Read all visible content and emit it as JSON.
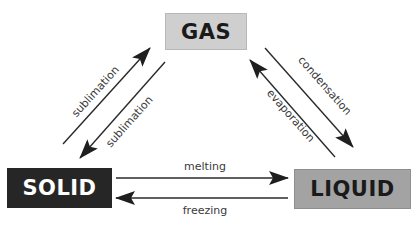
{
  "diagram": {
    "type": "phase-change-triangle",
    "nodes": {
      "gas": {
        "label": "GAS",
        "fill": "#cfcfcf",
        "text_color": "#1a1a1a"
      },
      "solid": {
        "label": "SOLID",
        "fill": "#262626",
        "text_color": "#ffffff"
      },
      "liquid": {
        "label": "LIQUID",
        "fill": "#a3a3a3",
        "text_color": "#1a1a1a"
      }
    },
    "edges": [
      {
        "from": "solid",
        "to": "gas",
        "label": "sublimation"
      },
      {
        "from": "gas",
        "to": "solid",
        "label": "sublimation"
      },
      {
        "from": "gas",
        "to": "liquid",
        "label": "condensation"
      },
      {
        "from": "liquid",
        "to": "gas",
        "label": "evaporation"
      },
      {
        "from": "solid",
        "to": "liquid",
        "label": "melting"
      },
      {
        "from": "liquid",
        "to": "solid",
        "label": "freezing"
      }
    ],
    "arrow_color": "#2a2a2a"
  }
}
